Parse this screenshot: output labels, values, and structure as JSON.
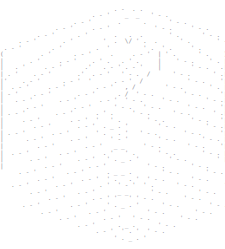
{
  "image": {
    "kind": "ascii-art",
    "subject": "hexagonal cube outline composed of nested chevron layers",
    "width_px": 225,
    "height_px": 249,
    "background_color": "#ffffff",
    "glyph_color": "#8d8d94",
    "font_size_px": 6.1,
    "line_height_px": 6.55,
    "columns": 62,
    "rows": 38,
    "glyph_set": [
      ".",
      "-",
      "'",
      ",",
      "_",
      "|",
      "/",
      "\\",
      "V",
      "(",
      ")",
      "`"
    ]
  },
  "art": {
    "lines": [
      "                                                              ",
      "                               . -  . .                       ",
      "                         . - '    _  _   ' - .                ",
      "                    . - '       .      .      ' - .           ",
      "               . - '     . - '            ' - .     ' - .     ",
      "          . - '      . '       .   .  .       ' .      ' - .  ",
      "     . - '       . '        '  .  \\/ ' .  .      ' .       ' -",
      " . - '        . '         .  '         ' .  ' .     ' .       ",
      "(          . '      . - '     .     . - '  | ' .      ' .    )",
      "|       . '     . - '    . ' .   . ' .     |    ' - .    ' . |",
      "|   . '     . - '      .'   . - ' . - '    |        ' - .   .|",
      "| . '    . - '       .'  . - '   ' - .  /      ' - .      ' .|",
      "|'    . - '      . - '  '      . - '  /            ' - .    '|",
      "|  . - '     . - '        . - '   , /        ' - .       ' . |",
      "| - '    . - '       . - '      . /  ' - .        ' - .     '|",
      "|   . - '       . - '      . - '  ' - .     ' - .       ' - .|",
      "|      . - '        . - '      ' - .   ' - .       ' - .    '|",
      "| . - '        . - '      . ' .     ' - .      ' - .      ' .|",
      "|     . - '        . - '  '   ' .       ' - .       ' - .   '|",
      "|        . - '       . - '  . _ . '        ' - .        ' - .|",
      "| . - '       . - '       ' .   . '   ' - .       ' - .     '|",
      "|      . - '       . - '      ' - '        ' - .       ' - . |",
      "|         . - '        . - '   _ _     ' - .       ' - .    '|",
      "|  . - '        . - '       . '   ' .      ' - .       ' - . |",
      "|       . - '        . - '   ' . _ . '        ' - .        ' |",
      "|           . - '       . - '           ' - .       ' - .    ",
      "     . - '        . - '      . _ _ .        ' - .       ' - . ",
      "          . - '       . - '  ' .   . '  ' - .       ' - .     ",
      "   . - '       . - '       . '  ' - '  ' .      ' - .        '",
      "        . - '        . - '      _ _      ' - .        ' - .   ",
      "             . - '       . - ' '   ' ' - .        ' - .       ",
      "      . - '        . - '     ' . _ . '      ' - .        ' - .",
      "           . - '        . - '           ' - .        ' - .    ",
      "                . - '       . - '   ' - .        ' - .        ",
      "                     . - '      . _ .      ' - .              ",
      "                          . - '  ' . '  ' - .                 ",
      "                               ' . _ . '                      ",
      "                                                              "
    ]
  }
}
